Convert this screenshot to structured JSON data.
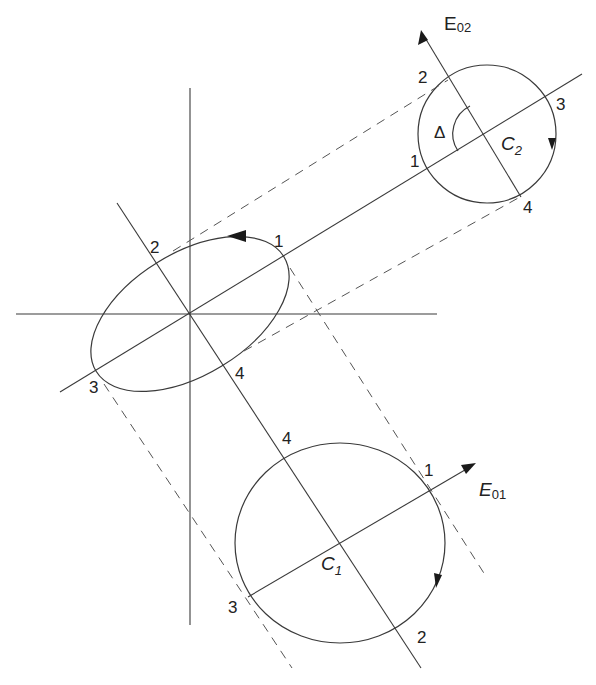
{
  "figure": {
    "ellipse": {
      "points": {
        "p1": "1",
        "p2": "2",
        "p3": "3",
        "p4": "4"
      }
    },
    "circle_c1": {
      "center_label": "C",
      "center_sub": "1",
      "points": {
        "p1": "1",
        "p2": "2",
        "p3": "3",
        "p4": "4"
      },
      "axis_label": "E",
      "axis_sub": "01"
    },
    "circle_c2": {
      "center_label": "C",
      "center_sub": "2",
      "points": {
        "p1": "1",
        "p2": "2",
        "p3": "3",
        "p4": "4"
      },
      "axis_label": "E",
      "axis_sub": "02",
      "angle_label": "Δ"
    }
  },
  "colors": {
    "line": "#3a3a3a",
    "dashed": "#555555",
    "background": "#ffffff"
  }
}
